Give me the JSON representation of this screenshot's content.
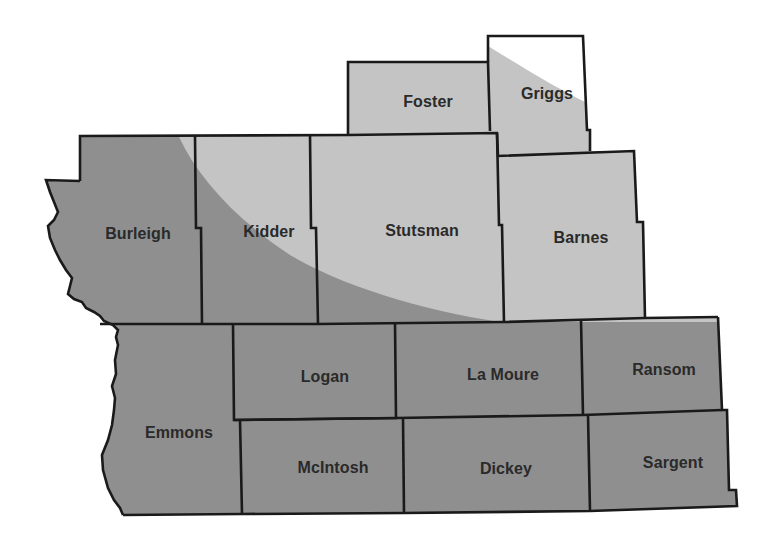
{
  "map": {
    "colors": {
      "light_zone": "#c4c4c4",
      "dark_zone": "#8f8f8f",
      "outside": "#ffffff",
      "border": "#1a1a1a",
      "label": "#2a2a2a"
    },
    "zones": [
      {
        "id": "light",
        "description": "lighter shaded zone (northeast)"
      },
      {
        "id": "dark",
        "description": "darker shaded zone (southwest)"
      },
      {
        "id": "unshaded",
        "description": "unshaded area (northeast corner of Griggs)"
      }
    ],
    "counties": [
      {
        "name": "Foster",
        "zone": "light",
        "label_x": 428,
        "label_y": 102
      },
      {
        "name": "Griggs",
        "zone": "light/unshaded",
        "label_x": 547,
        "label_y": 94
      },
      {
        "name": "Burleigh",
        "zone": "dark",
        "label_x": 138,
        "label_y": 234
      },
      {
        "name": "Kidder",
        "zone": "dark/light",
        "label_x": 269,
        "label_y": 232
      },
      {
        "name": "Stutsman",
        "zone": "light/dark",
        "label_x": 422,
        "label_y": 231
      },
      {
        "name": "Barnes",
        "zone": "light",
        "label_x": 581,
        "label_y": 238
      },
      {
        "name": "Logan",
        "zone": "dark",
        "label_x": 325,
        "label_y": 377
      },
      {
        "name": "La Moure",
        "zone": "dark",
        "label_x": 503,
        "label_y": 375
      },
      {
        "name": "Ransom",
        "zone": "dark",
        "label_x": 664,
        "label_y": 370
      },
      {
        "name": "Emmons",
        "zone": "dark",
        "label_x": 179,
        "label_y": 433
      },
      {
        "name": "McIntosh",
        "zone": "dark",
        "label_x": 333,
        "label_y": 468
      },
      {
        "name": "Dickey",
        "zone": "dark",
        "label_x": 506,
        "label_y": 469
      },
      {
        "name": "Sargent",
        "zone": "dark",
        "label_x": 673,
        "label_y": 463
      }
    ]
  }
}
